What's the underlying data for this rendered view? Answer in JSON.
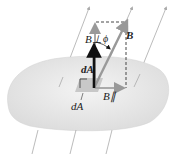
{
  "diagram": {
    "labels": {
      "b_perp": "B⊥",
      "phi": "ϕ",
      "b_vec": "B",
      "dA_vec": "dA",
      "dA": "dA",
      "b_parallel": "B∥"
    },
    "colors": {
      "surface": "#e8e8e8",
      "field_lines": "#9a9a9a",
      "b_vector": "#9a9a9a",
      "dA_vector": "#111111",
      "dashed": "#333333"
    }
  }
}
